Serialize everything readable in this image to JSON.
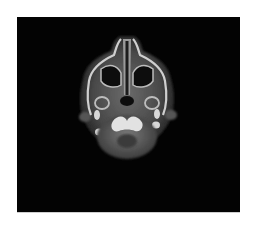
{
  "image": {
    "description": "Axial CT slice of the head at the level of the maxillary sinuses and skull base, shown on a black square background",
    "background_color": "#030303",
    "surround_color": "#ffffff",
    "structures": [
      "nasal-septum",
      "maxillary-sinuses",
      "mandibular-condyles",
      "skull-base",
      "posterior-fossa"
    ]
  }
}
